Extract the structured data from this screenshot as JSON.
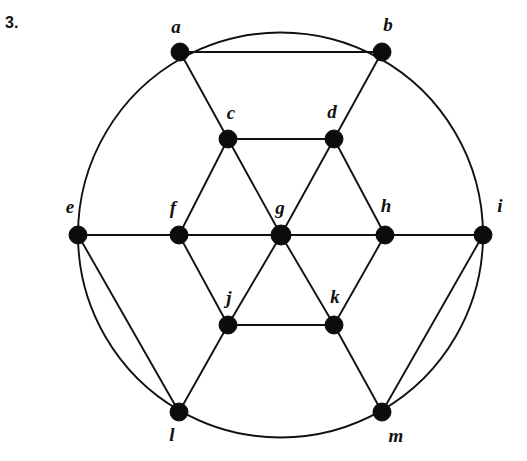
{
  "figure": {
    "problem_number": "3.",
    "caption": "",
    "type": "graph-diagram",
    "stroke_color": "#111111",
    "node_color": "#0c0c0c",
    "background_color": "#ffffff"
  },
  "chart_data": {
    "type": "graph",
    "title": "",
    "layout": {
      "width": 527,
      "height": 461,
      "outer_circle": {
        "cx": 280.5,
        "cy": 235,
        "r": 202.5
      }
    },
    "nodes": [
      {
        "id": "a",
        "label": "a",
        "x": 180,
        "y": 52,
        "r": 9,
        "label_dx": -4,
        "label_dy": -23
      },
      {
        "id": "b",
        "label": "b",
        "x": 382,
        "y": 52,
        "r": 9,
        "label_dx": 6,
        "label_dy": -25
      },
      {
        "id": "c",
        "label": "c",
        "x": 228,
        "y": 139,
        "r": 9,
        "label_dx": 3,
        "label_dy": -24
      },
      {
        "id": "d",
        "label": "d",
        "x": 334,
        "y": 139,
        "r": 9,
        "label_dx": -2,
        "label_dy": -25
      },
      {
        "id": "e",
        "label": "e",
        "x": 78,
        "y": 235,
        "r": 9,
        "label_dx": -8,
        "label_dy": -26
      },
      {
        "id": "f",
        "label": "f",
        "x": 179,
        "y": 235,
        "r": 9,
        "label_dx": -6,
        "label_dy": -25
      },
      {
        "id": "g",
        "label": "g",
        "x": 281,
        "y": 235,
        "r": 10,
        "label_dx": -1,
        "label_dy": -25
      },
      {
        "id": "h",
        "label": "h",
        "x": 385,
        "y": 235,
        "r": 9,
        "label_dx": 1,
        "label_dy": -27
      },
      {
        "id": "i",
        "label": "i",
        "x": 483,
        "y": 235,
        "r": 9,
        "label_dx": 17,
        "label_dy": -27
      },
      {
        "id": "j",
        "label": "j",
        "x": 228,
        "y": 325,
        "r": 9,
        "label_dx": 1,
        "label_dy": -25
      },
      {
        "id": "k",
        "label": "k",
        "x": 334,
        "y": 325,
        "r": 9,
        "label_dx": 1,
        "label_dy": -26
      },
      {
        "id": "l",
        "label": "l",
        "x": 179,
        "y": 412,
        "r": 9,
        "label_dx": -7,
        "label_dy": 25
      },
      {
        "id": "m",
        "label": "m",
        "x": 382,
        "y": 412,
        "r": 9,
        "label_dx": 14,
        "label_dy": 26
      }
    ],
    "straight_edges": [
      [
        "a",
        "b"
      ],
      [
        "a",
        "c"
      ],
      [
        "b",
        "d"
      ],
      [
        "c",
        "d"
      ],
      [
        "c",
        "f"
      ],
      [
        "c",
        "g"
      ],
      [
        "d",
        "g"
      ],
      [
        "d",
        "h"
      ],
      [
        "e",
        "f"
      ],
      [
        "f",
        "g"
      ],
      [
        "g",
        "h"
      ],
      [
        "h",
        "i"
      ],
      [
        "f",
        "j"
      ],
      [
        "g",
        "j"
      ],
      [
        "g",
        "k"
      ],
      [
        "h",
        "k"
      ],
      [
        "j",
        "k"
      ],
      [
        "j",
        "l"
      ],
      [
        "k",
        "m"
      ],
      [
        "e",
        "l"
      ],
      [
        "i",
        "m"
      ]
    ],
    "arc_edges": [
      {
        "from": "a",
        "to": "b",
        "note": "top circle arc"
      },
      {
        "from": "b",
        "to": "i",
        "note": "upper-right circle arc"
      },
      {
        "from": "i",
        "to": "m",
        "note": "lower-right circle arc"
      },
      {
        "from": "m",
        "to": "l",
        "note": "bottom circle arc"
      },
      {
        "from": "l",
        "to": "e",
        "note": "lower-left circle arc"
      },
      {
        "from": "e",
        "to": "a",
        "note": "upper-left circle arc"
      }
    ],
    "degrees": {
      "a": 4,
      "b": 4,
      "c": 4,
      "d": 4,
      "e": 4,
      "f": 4,
      "g": 6,
      "h": 4,
      "i": 4,
      "j": 4,
      "k": 4,
      "l": 4,
      "m": 4
    },
    "node_count": 13,
    "edge_count": 27
  }
}
